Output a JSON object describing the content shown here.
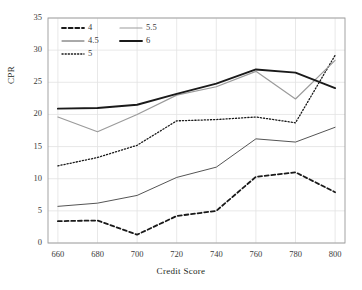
{
  "chart_data": {
    "type": "line",
    "title": "",
    "xlabel": "Credit Score",
    "ylabel": "CPR",
    "x": [
      660,
      680,
      700,
      720,
      740,
      760,
      780,
      800
    ],
    "xlim": [
      655,
      805
    ],
    "ylim": [
      0,
      35
    ],
    "yticks": [
      0,
      5,
      10,
      15,
      20,
      25,
      30,
      35
    ],
    "xticks": [
      660,
      680,
      700,
      720,
      740,
      760,
      780,
      800
    ],
    "grid": true,
    "legend_position": "top-left",
    "series": [
      {
        "name": "4",
        "style": "dashed",
        "color": "#1a1a1a",
        "width": 1.8,
        "values": [
          3.4,
          3.5,
          1.3,
          4.2,
          5.0,
          10.3,
          11.0,
          7.9
        ]
      },
      {
        "name": "4.5",
        "style": "solid",
        "color": "#555555",
        "width": 1.0,
        "values": [
          5.7,
          6.2,
          7.4,
          10.2,
          11.8,
          16.2,
          15.7,
          18.0
        ]
      },
      {
        "name": "5",
        "style": "dotted",
        "color": "#1a1a1a",
        "width": 1.3,
        "values": [
          12.0,
          13.3,
          15.2,
          19.0,
          19.2,
          19.6,
          18.7,
          29.2
        ]
      },
      {
        "name": "5.5",
        "style": "solid",
        "color": "#9b9b9b",
        "width": 1.2,
        "values": [
          19.6,
          17.3,
          20.0,
          23.0,
          24.3,
          26.7,
          22.4,
          28.4
        ]
      },
      {
        "name": "6",
        "style": "solid",
        "color": "#1a1a1a",
        "width": 1.9,
        "values": [
          20.9,
          21.0,
          21.5,
          23.2,
          24.8,
          27.0,
          26.5,
          24.1
        ]
      }
    ],
    "colors": {
      "grid": "#e2e2e2",
      "frame": "#9a9a9a",
      "text": "#231f20",
      "background": "#ffffff"
    }
  }
}
